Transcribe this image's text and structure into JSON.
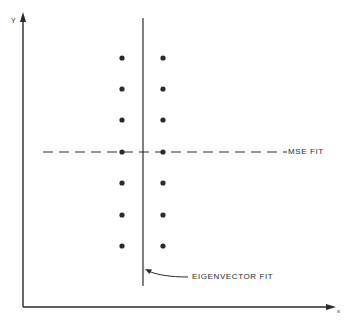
{
  "diagram": {
    "axes": {
      "y_label": "Y",
      "x_label": "X"
    },
    "annotations": {
      "mse_fit": "MSE FIT",
      "eigenvector_fit": "EIGENVECTOR FIT"
    },
    "colors": {
      "ink": "#2a2a2a",
      "background": "#ffffff"
    },
    "points": {
      "left_column_x": 122,
      "right_column_x": 163,
      "rows_y": [
        58,
        89,
        120,
        152,
        183,
        215,
        246
      ]
    }
  },
  "chart_data": {
    "type": "scatter",
    "title": "",
    "xlabel": "X",
    "ylabel": "Y",
    "series": [
      {
        "name": "data points (left column)",
        "x": [
          -1,
          -1,
          -1,
          -1,
          -1,
          -1,
          -1
        ],
        "y": [
          3,
          2,
          1,
          0,
          -1,
          -2,
          -3
        ]
      },
      {
        "name": "data points (right column)",
        "x": [
          1,
          1,
          1,
          1,
          1,
          1,
          1
        ],
        "y": [
          3,
          2,
          1,
          0,
          -1,
          -2,
          -3
        ]
      }
    ],
    "lines": [
      {
        "name": "MSE FIT",
        "style": "dashed",
        "orientation": "horizontal",
        "y": 0
      },
      {
        "name": "EIGENVECTOR FIT",
        "style": "solid",
        "orientation": "vertical",
        "x": 0
      }
    ],
    "grid": false,
    "legend": "none"
  }
}
